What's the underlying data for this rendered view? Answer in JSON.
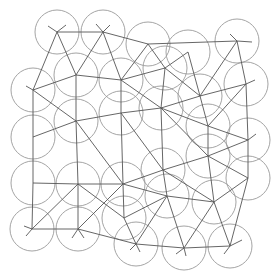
{
  "diagram": {
    "title": "",
    "type": "circle-packing-with-triangulation",
    "width": 280,
    "height": 274,
    "colors": {
      "background": "#ffffff",
      "circle_stroke": "#9a9a9a",
      "edge_stroke": "#555555"
    },
    "radius": 22,
    "nodes": [
      {
        "id": 0,
        "x": 57,
        "y": 32
      },
      {
        "id": 1,
        "x": 103,
        "y": 32
      },
      {
        "id": 2,
        "x": 148,
        "y": 44
      },
      {
        "id": 3,
        "x": 188,
        "y": 52
      },
      {
        "id": 4,
        "x": 237,
        "y": 41
      },
      {
        "id": 5,
        "x": 33,
        "y": 90
      },
      {
        "id": 6,
        "x": 76,
        "y": 75
      },
      {
        "id": 7,
        "x": 121,
        "y": 80
      },
      {
        "id": 8,
        "x": 165,
        "y": 68
      },
      {
        "id": 9,
        "x": 200,
        "y": 96
      },
      {
        "id": 10,
        "x": 246,
        "y": 84
      },
      {
        "id": 11,
        "x": 33,
        "y": 137
      },
      {
        "id": 12,
        "x": 76,
        "y": 121
      },
      {
        "id": 13,
        "x": 121,
        "y": 113
      },
      {
        "id": 14,
        "x": 161,
        "y": 108
      },
      {
        "id": 15,
        "x": 208,
        "y": 126
      },
      {
        "id": 16,
        "x": 33,
        "y": 183
      },
      {
        "id": 17,
        "x": 78,
        "y": 184
      },
      {
        "id": 18,
        "x": 123,
        "y": 184
      },
      {
        "id": 19,
        "x": 163,
        "y": 170
      },
      {
        "id": 20,
        "x": 208,
        "y": 156
      },
      {
        "id": 21,
        "x": 248,
        "y": 140
      },
      {
        "id": 22,
        "x": 32,
        "y": 229
      },
      {
        "id": 23,
        "x": 78,
        "y": 229
      },
      {
        "id": 24,
        "x": 124,
        "y": 218
      },
      {
        "id": 25,
        "x": 167,
        "y": 196
      },
      {
        "id": 26,
        "x": 214,
        "y": 202
      },
      {
        "id": 27,
        "x": 248,
        "y": 178
      },
      {
        "id": 28,
        "x": 136,
        "y": 244
      },
      {
        "id": 29,
        "x": 184,
        "y": 248
      },
      {
        "id": 30,
        "x": 230,
        "y": 246
      }
    ],
    "edges": [
      [
        0,
        1
      ],
      [
        1,
        2
      ],
      [
        2,
        4
      ],
      [
        0,
        5
      ],
      [
        0,
        6
      ],
      [
        1,
        6
      ],
      [
        1,
        7
      ],
      [
        2,
        7
      ],
      [
        2,
        8
      ],
      [
        3,
        8
      ],
      [
        3,
        9
      ],
      [
        4,
        10
      ],
      [
        4,
        9
      ],
      [
        5,
        6
      ],
      [
        6,
        7
      ],
      [
        7,
        8
      ],
      [
        8,
        9
      ],
      [
        9,
        10
      ],
      [
        8,
        14
      ],
      [
        7,
        13
      ],
      [
        6,
        12
      ],
      [
        5,
        11
      ],
      [
        5,
        12
      ],
      [
        7,
        14
      ],
      [
        9,
        14
      ],
      [
        9,
        15
      ],
      [
        10,
        15
      ],
      [
        10,
        21
      ],
      [
        11,
        12
      ],
      [
        12,
        13
      ],
      [
        13,
        14
      ],
      [
        14,
        15
      ],
      [
        15,
        21
      ],
      [
        11,
        16
      ],
      [
        12,
        17
      ],
      [
        12,
        18
      ],
      [
        13,
        18
      ],
      [
        13,
        19
      ],
      [
        14,
        19
      ],
      [
        14,
        20
      ],
      [
        15,
        20
      ],
      [
        20,
        21
      ],
      [
        16,
        17
      ],
      [
        17,
        18
      ],
      [
        18,
        19
      ],
      [
        19,
        20
      ],
      [
        20,
        27
      ],
      [
        21,
        27
      ],
      [
        16,
        22
      ],
      [
        17,
        23
      ],
      [
        17,
        24
      ],
      [
        18,
        24
      ],
      [
        18,
        25
      ],
      [
        19,
        25
      ],
      [
        19,
        26
      ],
      [
        20,
        26
      ],
      [
        26,
        27
      ],
      [
        22,
        23
      ],
      [
        22,
        17
      ],
      [
        23,
        18
      ],
      [
        24,
        25
      ],
      [
        25,
        26
      ],
      [
        24,
        28
      ],
      [
        25,
        28
      ],
      [
        25,
        29
      ],
      [
        26,
        29
      ],
      [
        26,
        30
      ],
      [
        27,
        30
      ],
      [
        23,
        28
      ],
      [
        28,
        29
      ],
      [
        29,
        30
      ]
    ],
    "stubs": [
      [
        57,
        32,
        48,
        26
      ],
      [
        57,
        32,
        66,
        25
      ],
      [
        103,
        32,
        96,
        24
      ],
      [
        103,
        32,
        110,
        25
      ],
      [
        237,
        41,
        230,
        34
      ],
      [
        237,
        41,
        252,
        42
      ],
      [
        33,
        90,
        26,
        86
      ],
      [
        32,
        229,
        26,
        236
      ],
      [
        32,
        229,
        24,
        226
      ],
      [
        78,
        229,
        72,
        238
      ],
      [
        78,
        229,
        84,
        238
      ],
      [
        136,
        244,
        130,
        250
      ],
      [
        136,
        244,
        140,
        252
      ],
      [
        184,
        248,
        176,
        254
      ],
      [
        184,
        248,
        186,
        256
      ],
      [
        230,
        246,
        224,
        254
      ],
      [
        230,
        246,
        242,
        240
      ],
      [
        246,
        84,
        255,
        80
      ],
      [
        248,
        140,
        256,
        134
      ]
    ]
  }
}
